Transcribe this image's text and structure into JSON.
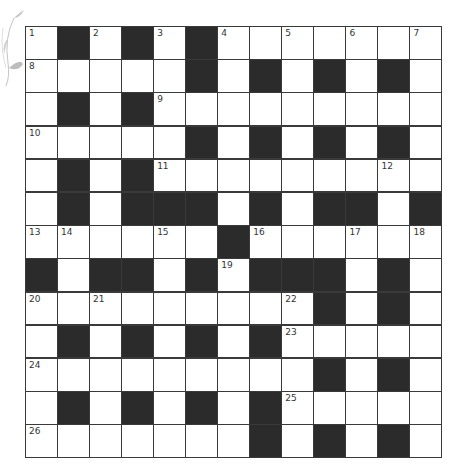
{
  "puzzle": {
    "type": "crossword",
    "rows": 13,
    "cols": 13,
    "colors": {
      "black_cell": "#2b2b2b",
      "white_cell": "#ffffff",
      "grid_line": "#3a3a3a",
      "number": "#333333",
      "decoration": "#bbbbbb"
    },
    "decoration_icon": "leaf-sprig-icon",
    "grid": [
      [
        "1",
        "#",
        "2",
        "#",
        "3",
        "#",
        "4",
        "",
        "5",
        "",
        "6",
        "",
        "7"
      ],
      [
        "8",
        "",
        "",
        "",
        "",
        "#",
        "",
        "#",
        "",
        "#",
        "",
        "#",
        ""
      ],
      [
        "",
        "#",
        "",
        "#",
        "9",
        "",
        "",
        "",
        "",
        "",
        "",
        "",
        ""
      ],
      [
        "10",
        "",
        "",
        "",
        "",
        "#",
        "",
        "#",
        "",
        "#",
        "",
        "#",
        ""
      ],
      [
        "",
        "#",
        "",
        "#",
        "11",
        "",
        "",
        "",
        "",
        "",
        "",
        "12",
        ""
      ],
      [
        "",
        "#",
        "",
        "#",
        "#",
        "#",
        "",
        "#",
        "",
        "#",
        "#",
        "",
        "#"
      ],
      [
        "13",
        "14",
        "",
        "",
        "15",
        "",
        "#",
        "16",
        "",
        "",
        "17",
        "",
        "18"
      ],
      [
        "#",
        "",
        "#",
        "#",
        "",
        "#",
        "19",
        "#",
        "#",
        "#",
        "",
        "#",
        ""
      ],
      [
        "20",
        "",
        "21",
        "",
        "",
        "",
        "",
        "",
        "22",
        "#",
        "",
        "#",
        ""
      ],
      [
        "",
        "#",
        "",
        "#",
        "",
        "#",
        "",
        "#",
        "23",
        "",
        "",
        "",
        ""
      ],
      [
        "24",
        "",
        "",
        "",
        "",
        "",
        "",
        "",
        "",
        "#",
        "",
        "#",
        ""
      ],
      [
        "",
        "#",
        "",
        "#",
        "",
        "#",
        "",
        "#",
        "25",
        "",
        "",
        "",
        ""
      ],
      [
        "26",
        "",
        "",
        "",
        "",
        "",
        "",
        "#",
        "",
        "#",
        "",
        "#",
        ""
      ]
    ]
  }
}
